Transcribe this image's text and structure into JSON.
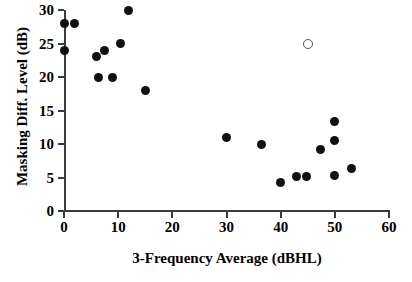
{
  "chart_data": {
    "type": "scatter",
    "title": "",
    "xlabel": "3-Frequency Average (dBHL)",
    "ylabel": "Masking Diff. Level (dB)",
    "xlim": [
      0,
      60
    ],
    "ylim": [
      0,
      30
    ],
    "xticks": [
      0,
      10,
      20,
      30,
      40,
      50,
      60
    ],
    "yticks": [
      0,
      5,
      10,
      15,
      20,
      25,
      30
    ],
    "xtick_labels": [
      "0",
      "10",
      "20",
      "30",
      "40",
      "50",
      "60"
    ],
    "ytick_labels": [
      "0",
      "5",
      "10",
      "15",
      "20",
      "25",
      "30"
    ],
    "grid": false,
    "legend": "none",
    "series": [
      {
        "name": "filled",
        "marker": "filled-circle",
        "color": "#111111",
        "points": [
          {
            "x": 0.0,
            "y": 28.0
          },
          {
            "x": 0.0,
            "y": 24.0
          },
          {
            "x": 2.0,
            "y": 28.0
          },
          {
            "x": 6.0,
            "y": 23.0
          },
          {
            "x": 7.5,
            "y": 24.0
          },
          {
            "x": 6.3,
            "y": 20.0
          },
          {
            "x": 9.0,
            "y": 20.0
          },
          {
            "x": 10.4,
            "y": 25.0
          },
          {
            "x": 11.9,
            "y": 30.0
          },
          {
            "x": 15.0,
            "y": 18.0
          },
          {
            "x": 30.0,
            "y": 11.0
          },
          {
            "x": 36.5,
            "y": 10.0
          },
          {
            "x": 40.0,
            "y": 4.3
          },
          {
            "x": 43.0,
            "y": 5.2
          },
          {
            "x": 44.8,
            "y": 5.2
          },
          {
            "x": 47.4,
            "y": 9.2
          },
          {
            "x": 50.0,
            "y": 13.4
          },
          {
            "x": 50.0,
            "y": 10.5
          },
          {
            "x": 50.0,
            "y": 5.3
          },
          {
            "x": 53.0,
            "y": 6.4
          }
        ]
      },
      {
        "name": "open",
        "marker": "open-circle",
        "color": "#555555",
        "points": [
          {
            "x": 45.0,
            "y": 25.0
          }
        ]
      }
    ]
  }
}
